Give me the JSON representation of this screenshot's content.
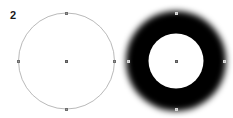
{
  "canvas": {
    "width": 233,
    "height": 118,
    "background_color": "#ffffff"
  },
  "figure": {
    "label": "2"
  },
  "shapes": [
    {
      "name": "outline-circle",
      "kind": "circle-outline",
      "center_x": 66.5,
      "center_y": 61,
      "radius": 48,
      "stroke_color": "#9b9b9b",
      "stroke_width": 0.7,
      "fill": "none"
    },
    {
      "name": "blurred-ring",
      "kind": "ring-blurred",
      "center_x": 176,
      "center_y": 61,
      "outer_radius": 50,
      "inner_radius": 27.5,
      "fill_color": "#000000",
      "outer_blur": 7,
      "inner_blur": 1.5
    }
  ],
  "handles": {
    "color": "#9a9a9a",
    "border_color": "#6e6e6e",
    "size": 3,
    "left_shape": [
      {
        "name": "handle-north",
        "x": 66.5,
        "y": 13
      },
      {
        "name": "handle-south",
        "x": 66.5,
        "y": 109
      },
      {
        "name": "handle-west",
        "x": 18.5,
        "y": 61
      },
      {
        "name": "handle-east",
        "x": 114.5,
        "y": 61
      },
      {
        "name": "handle-center",
        "x": 66.5,
        "y": 61
      }
    ],
    "right_shape": [
      {
        "name": "handle-north",
        "x": 176,
        "y": 13
      },
      {
        "name": "handle-south",
        "x": 176,
        "y": 109
      },
      {
        "name": "handle-west",
        "x": 128,
        "y": 61
      },
      {
        "name": "handle-east",
        "x": 224,
        "y": 61
      },
      {
        "name": "handle-center",
        "x": 176,
        "y": 61
      }
    ]
  }
}
